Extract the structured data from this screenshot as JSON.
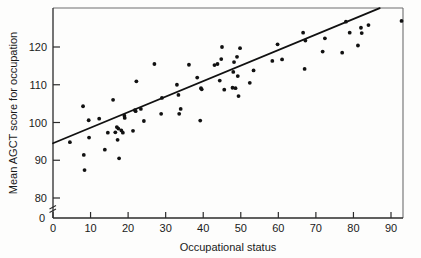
{
  "chart_data": {
    "type": "scatter",
    "title": "",
    "xlabel": "Occupational status",
    "ylabel": "Mean AGCT score for occupation",
    "xlim": [
      0,
      93
    ],
    "ylim": [
      78,
      130
    ],
    "xticks": [
      0,
      10,
      20,
      30,
      40,
      50,
      60,
      70,
      80,
      90
    ],
    "xticklabels": [
      "0",
      "10",
      "20",
      "30",
      "40",
      "50",
      "60",
      "70",
      "80",
      "90"
    ],
    "yticks": [
      80,
      90,
      100,
      110,
      120
    ],
    "yticklabels": [
      "80",
      "90",
      "100",
      "110",
      "120"
    ],
    "y_origin_label": "0",
    "y_axis_break": true,
    "grid": false,
    "legend": null,
    "marker": "filled-circle",
    "marker_color": "#111111",
    "line_color": "#111111",
    "frame_color": "#6e6e6e",
    "background_color": "#fdfdfc",
    "trendline": {
      "label": "regression line",
      "x": [
        0,
        87
      ],
      "y": [
        94.5,
        130.3
      ]
    },
    "points": [
      {
        "x": 4.5,
        "y": 94.8
      },
      {
        "x": 8.0,
        "y": 104.3
      },
      {
        "x": 8.2,
        "y": 91.4
      },
      {
        "x": 8.4,
        "y": 87.4
      },
      {
        "x": 9.5,
        "y": 100.6
      },
      {
        "x": 9.6,
        "y": 96.0
      },
      {
        "x": 12.3,
        "y": 101.0
      },
      {
        "x": 13.8,
        "y": 92.8
      },
      {
        "x": 14.6,
        "y": 97.3
      },
      {
        "x": 16.0,
        "y": 106.0
      },
      {
        "x": 16.6,
        "y": 97.4
      },
      {
        "x": 17.0,
        "y": 98.8
      },
      {
        "x": 17.2,
        "y": 95.4
      },
      {
        "x": 17.4,
        "y": 98.4
      },
      {
        "x": 17.6,
        "y": 90.5
      },
      {
        "x": 18.2,
        "y": 97.9
      },
      {
        "x": 18.6,
        "y": 97.3
      },
      {
        "x": 19.0,
        "y": 101.8
      },
      {
        "x": 19.1,
        "y": 101.2
      },
      {
        "x": 21.3,
        "y": 97.8
      },
      {
        "x": 21.8,
        "y": 103.3
      },
      {
        "x": 22.0,
        "y": 103.0
      },
      {
        "x": 22.2,
        "y": 110.9
      },
      {
        "x": 23.4,
        "y": 103.6
      },
      {
        "x": 24.2,
        "y": 100.4
      },
      {
        "x": 27.0,
        "y": 115.5
      },
      {
        "x": 28.8,
        "y": 102.3
      },
      {
        "x": 29.0,
        "y": 106.5
      },
      {
        "x": 33.0,
        "y": 110.0
      },
      {
        "x": 33.4,
        "y": 107.3
      },
      {
        "x": 33.6,
        "y": 102.3
      },
      {
        "x": 34.0,
        "y": 103.6
      },
      {
        "x": 36.2,
        "y": 115.3
      },
      {
        "x": 38.4,
        "y": 111.9
      },
      {
        "x": 39.2,
        "y": 100.5
      },
      {
        "x": 39.4,
        "y": 109.1
      },
      {
        "x": 39.6,
        "y": 108.8
      },
      {
        "x": 43.0,
        "y": 115.2
      },
      {
        "x": 43.8,
        "y": 115.5
      },
      {
        "x": 44.4,
        "y": 111.1
      },
      {
        "x": 44.8,
        "y": 116.8
      },
      {
        "x": 45.0,
        "y": 120.0
      },
      {
        "x": 45.6,
        "y": 108.7
      },
      {
        "x": 47.8,
        "y": 109.2
      },
      {
        "x": 48.0,
        "y": 113.4
      },
      {
        "x": 48.2,
        "y": 116.0
      },
      {
        "x": 48.6,
        "y": 109.1
      },
      {
        "x": 49.0,
        "y": 117.4
      },
      {
        "x": 49.2,
        "y": 112.3
      },
      {
        "x": 49.4,
        "y": 107.0
      },
      {
        "x": 49.8,
        "y": 119.7
      },
      {
        "x": 52.4,
        "y": 110.5
      },
      {
        "x": 53.4,
        "y": 113.8
      },
      {
        "x": 58.4,
        "y": 116.3
      },
      {
        "x": 59.8,
        "y": 120.7
      },
      {
        "x": 61.0,
        "y": 116.7
      },
      {
        "x": 66.6,
        "y": 123.8
      },
      {
        "x": 67.0,
        "y": 114.2
      },
      {
        "x": 67.2,
        "y": 121.7
      },
      {
        "x": 71.8,
        "y": 118.8
      },
      {
        "x": 72.4,
        "y": 122.3
      },
      {
        "x": 77.0,
        "y": 118.5
      },
      {
        "x": 78.0,
        "y": 126.7
      },
      {
        "x": 79.0,
        "y": 123.8
      },
      {
        "x": 81.2,
        "y": 120.4
      },
      {
        "x": 82.0,
        "y": 125.1
      },
      {
        "x": 82.2,
        "y": 123.7
      },
      {
        "x": 84.0,
        "y": 125.8
      },
      {
        "x": 92.8,
        "y": 126.9
      }
    ]
  }
}
